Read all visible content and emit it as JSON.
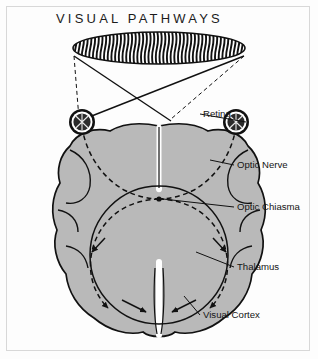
{
  "figure": {
    "title": "VISUAL PATHWAYS",
    "background_color": "#fdfdfd",
    "frame_color": "#d8d8d8",
    "ink_color": "#111111",
    "brain_fill_color": "#b9b9b9",
    "eye_fill_color": "#2b2b2b",
    "width": 318,
    "height": 359
  },
  "visual_field": {
    "name": "striped-visual-field-ellipse",
    "stripe_color": "#111111",
    "stripe_count": 46
  },
  "eyes": [
    {
      "side": "left",
      "name": "left-eye"
    },
    {
      "side": "right",
      "name": "right-eye"
    }
  ],
  "labels": [
    {
      "id": "retina",
      "text": "Retina",
      "x": 203,
      "y": 117
    },
    {
      "id": "optic-nerve",
      "text": "Optic Nerve",
      "x": 237,
      "y": 168
    },
    {
      "id": "optic-chiasma",
      "text": "Optic Chiasma",
      "x": 237,
      "y": 210
    },
    {
      "id": "thalamus",
      "text": "Thalamus",
      "x": 237,
      "y": 270
    },
    {
      "id": "visual-cortex",
      "text": "Visual Cortex",
      "x": 203,
      "y": 318
    }
  ],
  "pathways": {
    "field_to_eye_same_side": "dashed",
    "field_to_eye_crossed": "solid",
    "optic_tract_style": "dashed",
    "arrowheads": 4
  }
}
